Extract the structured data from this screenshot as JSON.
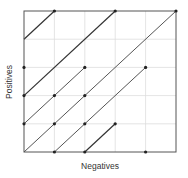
{
  "chart_data": {
    "type": "line",
    "title": "",
    "xlabel": "Negatives",
    "ylabel": "Positives",
    "xlim": [
      0,
      5
    ],
    "ylim": [
      0,
      5
    ],
    "grid": true,
    "legend": null,
    "tick_labels_visible": false,
    "series": [
      {
        "name": "segment-1",
        "color": "#333333",
        "width": 1.2,
        "points": [
          [
            0,
            4
          ],
          [
            1,
            5
          ]
        ]
      },
      {
        "name": "segment-2",
        "color": "#333333",
        "width": 1.2,
        "points": [
          [
            0,
            2
          ],
          [
            3,
            5
          ]
        ]
      },
      {
        "name": "segment-3",
        "color": "#555555",
        "width": 1.0,
        "points": [
          [
            0,
            1
          ],
          [
            2,
            3
          ]
        ]
      },
      {
        "name": "segment-4",
        "color": "#555555",
        "width": 1.0,
        "points": [
          [
            0,
            0
          ],
          [
            5,
            5
          ]
        ]
      },
      {
        "name": "segment-5",
        "color": "#555555",
        "width": 1.0,
        "points": [
          [
            1,
            0
          ],
          [
            4,
            3
          ]
        ]
      },
      {
        "name": "segment-6",
        "color": "#333333",
        "width": 1.2,
        "points": [
          [
            2,
            0
          ],
          [
            3,
            1
          ]
        ]
      }
    ],
    "points": [
      [
        1,
        5
      ],
      [
        3,
        5
      ],
      [
        5,
        5
      ],
      [
        0,
        3
      ],
      [
        2,
        3
      ],
      [
        4,
        3
      ],
      [
        0,
        2
      ],
      [
        1,
        2
      ],
      [
        2,
        2
      ],
      [
        0,
        1
      ],
      [
        1,
        1
      ],
      [
        2,
        1
      ],
      [
        3,
        1
      ],
      [
        1,
        0
      ],
      [
        2,
        0
      ],
      [
        4,
        0
      ]
    ],
    "colors": {
      "frame": "#555555",
      "grid": "#dddddd",
      "point": "#222222"
    }
  }
}
